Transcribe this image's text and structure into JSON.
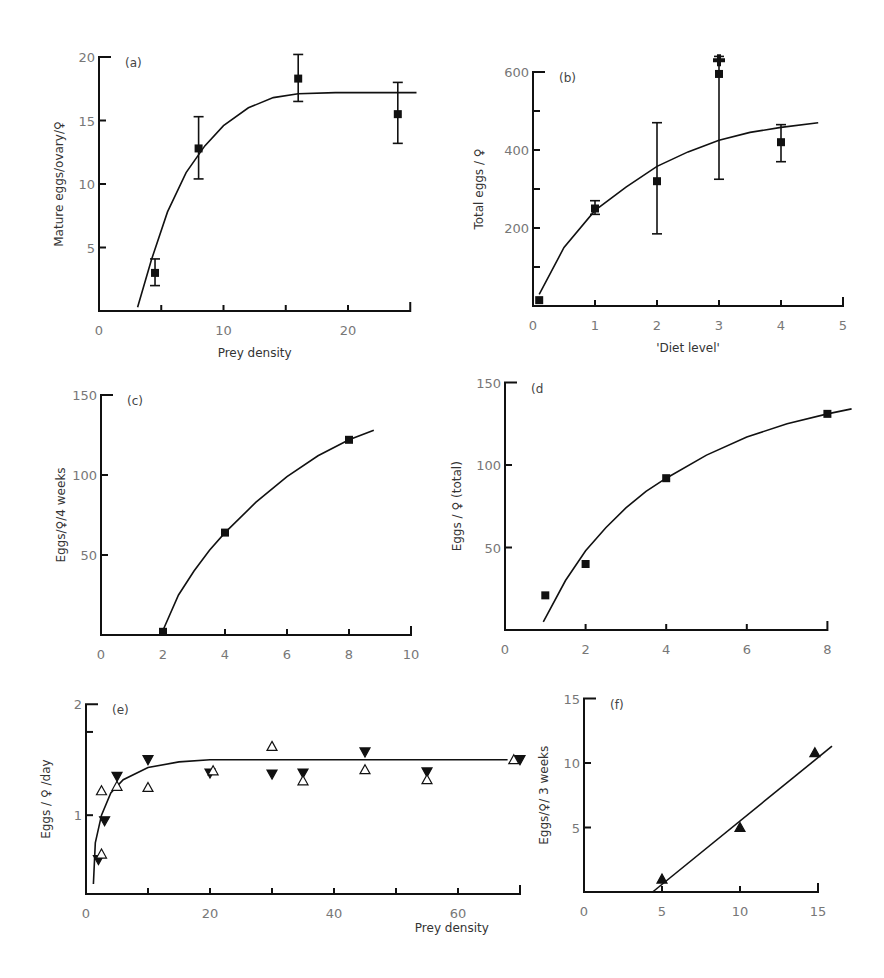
{
  "figure": {
    "background": "#ffffff",
    "ink": "#111111"
  },
  "chart_data": [
    {
      "panel": "a",
      "label": "(a)",
      "type": "scatter",
      "xlabel": "Prey density",
      "ylabel": "Mature eggs/ovary/♀",
      "xlim": [
        0,
        25
      ],
      "ylim": [
        0,
        20
      ],
      "xticks": [
        0,
        5,
        10,
        15,
        20,
        25
      ],
      "xtick_labels": [
        "0",
        "",
        "10",
        "",
        "20",
        ""
      ],
      "yticks": [
        5,
        10,
        15,
        20
      ],
      "ytick_labels": [
        "5",
        "10",
        "15",
        "20"
      ],
      "marker": "filled-square",
      "points": [
        {
          "x": 4.5,
          "y": 3.0,
          "err_low": 2.0,
          "err_high": 4.1
        },
        {
          "x": 8.0,
          "y": 12.8,
          "err_low": 10.4,
          "err_high": 15.3
        },
        {
          "x": 16.0,
          "y": 18.3,
          "err_low": 16.5,
          "err_high": 20.2
        },
        {
          "x": 24.0,
          "y": 15.5,
          "err_low": 13.2,
          "err_high": 18.0
        }
      ],
      "fit_curve": [
        [
          3.1,
          0.3
        ],
        [
          4.2,
          4.0
        ],
        [
          5.5,
          7.8
        ],
        [
          7.0,
          10.9
        ],
        [
          8.5,
          13.0
        ],
        [
          10,
          14.6
        ],
        [
          12,
          16.0
        ],
        [
          14,
          16.8
        ],
        [
          16,
          17.1
        ],
        [
          19,
          17.2
        ],
        [
          22,
          17.2
        ],
        [
          25.5,
          17.2
        ]
      ]
    },
    {
      "panel": "b",
      "label": "(b)",
      "type": "scatter",
      "xlabel": "'Diet level'",
      "ylabel": "Total eggs / ♀",
      "xlim": [
        0,
        5
      ],
      "ylim": [
        0,
        600
      ],
      "xticks": [
        0,
        1,
        2,
        3,
        4,
        5
      ],
      "xtick_labels": [
        "0",
        "1",
        "2",
        "3",
        "4",
        "5"
      ],
      "yticks": [
        100,
        200,
        300,
        400,
        500,
        600
      ],
      "ytick_labels": [
        "",
        "200",
        "",
        "400",
        "",
        "600"
      ],
      "marker": "filled-square",
      "points": [
        {
          "x": 0.1,
          "y": 15
        },
        {
          "x": 1.0,
          "y": 250,
          "err_low": 235,
          "err_high": 270
        },
        {
          "x": 2.0,
          "y": 320,
          "err_low": 185,
          "err_high": 470
        },
        {
          "x": 3.0,
          "y": 595,
          "err_low": 325,
          "err_high": 640
        },
        {
          "x": 4.0,
          "y": 420,
          "err_low": 370,
          "err_high": 465
        }
      ],
      "extra_marker": {
        "x": 3.0,
        "y": 630,
        "shape": "cross"
      },
      "fit_curve": [
        [
          0.1,
          30
        ],
        [
          0.5,
          150
        ],
        [
          1.0,
          245
        ],
        [
          1.5,
          305
        ],
        [
          2.0,
          358
        ],
        [
          2.5,
          395
        ],
        [
          3.0,
          425
        ],
        [
          3.5,
          445
        ],
        [
          4.0,
          458
        ],
        [
          4.6,
          470
        ]
      ]
    },
    {
      "panel": "c",
      "label": "(c)",
      "type": "scatter",
      "xlabel": "",
      "ylabel": "Eggs/♀/4 weeks",
      "xlim": [
        0,
        10
      ],
      "ylim": [
        0,
        150
      ],
      "xticks": [
        0,
        2,
        4,
        6,
        8,
        10
      ],
      "xtick_labels": [
        "0",
        "2",
        "4",
        "6",
        "8",
        "10"
      ],
      "yticks": [
        50,
        100,
        150
      ],
      "ytick_labels": [
        "50",
        "100",
        "150"
      ],
      "marker": "filled-square",
      "points": [
        {
          "x": 2.0,
          "y": 2
        },
        {
          "x": 4.0,
          "y": 64
        },
        {
          "x": 8.0,
          "y": 122
        }
      ],
      "fit_curve": [
        [
          2.0,
          3
        ],
        [
          2.5,
          25
        ],
        [
          3.0,
          40
        ],
        [
          3.5,
          53
        ],
        [
          4.0,
          64
        ],
        [
          5.0,
          83
        ],
        [
          6.0,
          99
        ],
        [
          7.0,
          112
        ],
        [
          8.0,
          122
        ],
        [
          8.8,
          128
        ]
      ]
    },
    {
      "panel": "d",
      "label": "(d",
      "type": "scatter",
      "xlabel": "",
      "ylabel": "Eggs / ♀ (total)",
      "xlim": [
        0,
        8
      ],
      "ylim": [
        0,
        150
      ],
      "xticks": [
        0,
        2,
        4,
        6,
        8
      ],
      "xtick_labels": [
        "0",
        "2",
        "4",
        "6",
        "8"
      ],
      "yticks": [
        50,
        100,
        150
      ],
      "ytick_labels": [
        "50",
        "100",
        "150"
      ],
      "marker": "filled-square",
      "points": [
        {
          "x": 1.0,
          "y": 21
        },
        {
          "x": 2.0,
          "y": 40
        },
        {
          "x": 4.0,
          "y": 92
        },
        {
          "x": 8.0,
          "y": 131
        }
      ],
      "fit_curve": [
        [
          0.95,
          5
        ],
        [
          1.5,
          30
        ],
        [
          2.0,
          48
        ],
        [
          2.5,
          62
        ],
        [
          3.0,
          74
        ],
        [
          3.5,
          84
        ],
        [
          4.0,
          92
        ],
        [
          5.0,
          106
        ],
        [
          6.0,
          117
        ],
        [
          7.0,
          125
        ],
        [
          8.0,
          131
        ],
        [
          8.6,
          134
        ]
      ]
    },
    {
      "panel": "e",
      "label": "(e)",
      "type": "scatter",
      "xlabel": "Prey density",
      "ylabel": "Eggs / ♀ /day",
      "xlim": [
        0,
        70
      ],
      "ylim": [
        0.3,
        2
      ],
      "xticks": [
        0,
        10,
        20,
        30,
        40,
        50,
        60,
        70
      ],
      "xtick_labels": [
        "0",
        "",
        "20",
        "",
        "40",
        "",
        "60",
        ""
      ],
      "yticks": [
        1,
        1.75,
        2
      ],
      "ytick_labels": [
        "1",
        "",
        "2"
      ],
      "series": [
        {
          "name": "filled-down-triangle",
          "marker": "filled-down-triangle",
          "points": [
            [
              2.0,
              0.6
            ],
            [
              3.0,
              0.95
            ],
            [
              5.0,
              1.35
            ],
            [
              10.0,
              1.5
            ],
            [
              20.0,
              1.38
            ],
            [
              30.0,
              1.37
            ],
            [
              35.0,
              1.38
            ],
            [
              45.0,
              1.57
            ],
            [
              55.0,
              1.39
            ],
            [
              70.0,
              1.5
            ]
          ]
        },
        {
          "name": "open-up-triangle",
          "marker": "open-up-triangle",
          "points": [
            [
              2.5,
              0.65
            ],
            [
              2.5,
              1.22
            ],
            [
              5.0,
              1.26
            ],
            [
              10.0,
              1.25
            ],
            [
              20.5,
              1.4
            ],
            [
              30.0,
              1.62
            ],
            [
              35.0,
              1.31
            ],
            [
              45.0,
              1.41
            ],
            [
              55.0,
              1.32
            ],
            [
              69.0,
              1.5
            ]
          ]
        }
      ],
      "fit_curve": [
        [
          1.2,
          0.38
        ],
        [
          1.5,
          0.75
        ],
        [
          2.5,
          1.0
        ],
        [
          4.0,
          1.2
        ],
        [
          6.0,
          1.32
        ],
        [
          10.0,
          1.43
        ],
        [
          15.0,
          1.48
        ],
        [
          20.0,
          1.5
        ],
        [
          44.0,
          1.5
        ],
        [
          46.0,
          1.5
        ],
        [
          68.0,
          1.5
        ]
      ]
    },
    {
      "panel": "f",
      "label": "(f)",
      "type": "scatter",
      "xlabel": "",
      "ylabel": "Eggs/♀/ 3 weeks",
      "xlim": [
        0,
        15
      ],
      "ylim": [
        0,
        15
      ],
      "xticks": [
        0,
        5,
        10,
        15
      ],
      "xtick_labels": [
        "0",
        "5",
        "10",
        "15"
      ],
      "yticks": [
        5,
        10,
        15
      ],
      "ytick_labels": [
        "5",
        "10",
        "15"
      ],
      "marker": "filled-up-triangle",
      "points": [
        {
          "x": 5.0,
          "y": 1.0
        },
        {
          "x": 10.0,
          "y": 5.0
        },
        {
          "x": 14.8,
          "y": 10.8
        }
      ],
      "fit_curve": [
        [
          4.4,
          0
        ],
        [
          15.9,
          11.3
        ]
      ]
    }
  ],
  "panels_layout": {
    "a": {
      "origin_x": 99,
      "origin_y": 311,
      "px_per_x": 12.45,
      "px_per_y": 12.7
    },
    "b": {
      "origin_x": 533,
      "origin_y": 306,
      "px_per_x": 62.0,
      "px_per_y": 0.39
    },
    "c": {
      "origin_x": 101,
      "origin_y": 635,
      "px_per_x": 31.0,
      "px_per_y": 1.6
    },
    "d": {
      "origin_x": 505,
      "origin_y": 630,
      "px_per_x": 40.3,
      "px_per_y": 1.65
    },
    "e": {
      "origin_x": 86,
      "origin_y": 894,
      "px_per_x": 6.2,
      "px_per_y": 111,
      "y_base": 0.29
    },
    "f": {
      "origin_x": 584,
      "origin_y": 892,
      "px_per_x": 15.6,
      "px_per_y": 12.9
    }
  }
}
